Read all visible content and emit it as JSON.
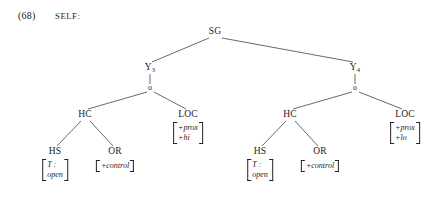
{
  "example": {
    "number": "(68)",
    "label": "SELF:"
  },
  "style": {
    "background": "#ffffff",
    "ink": "#1a1a1a",
    "line": "#444444"
  },
  "tree": {
    "root": {
      "label": "SG",
      "x": 215,
      "y": 32
    },
    "branches": [
      {
        "name": "left",
        "head": {
          "label": "Y",
          "sub": "3",
          "x": 150,
          "y": 68
        },
        "junction": {
          "label": "o",
          "x": 150,
          "y": 88
        },
        "children": [
          {
            "name": "hc",
            "label": "HC",
            "x": 85,
            "y": 115,
            "children": [
              {
                "name": "hs",
                "label": "HS",
                "x": 55,
                "y": 152,
                "features": [
                  "T :",
                  "open"
                ]
              },
              {
                "name": "or",
                "label": "OR",
                "x": 115,
                "y": 152,
                "features": [
                  "+control"
                ]
              }
            ]
          },
          {
            "name": "loc",
            "label": "LOC",
            "x": 188,
            "y": 115,
            "features": [
              "+prox",
              "+hi"
            ]
          }
        ]
      },
      {
        "name": "right",
        "head": {
          "label": "Y",
          "sub": "4",
          "x": 355,
          "y": 68
        },
        "junction": {
          "label": "o",
          "x": 355,
          "y": 88
        },
        "children": [
          {
            "name": "hc",
            "label": "HC",
            "x": 290,
            "y": 115,
            "children": [
              {
                "name": "hs",
                "label": "HS",
                "x": 260,
                "y": 152,
                "features": [
                  "T :",
                  "open"
                ]
              },
              {
                "name": "or",
                "label": "OR",
                "x": 320,
                "y": 152,
                "features": [
                  "+control"
                ]
              }
            ]
          },
          {
            "name": "loc",
            "label": "LOC",
            "x": 405,
            "y": 115,
            "features": [
              "+prox",
              "+lo"
            ]
          }
        ]
      }
    ]
  }
}
